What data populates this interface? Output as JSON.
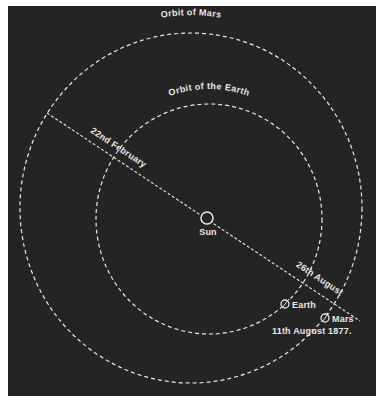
{
  "diagram": {
    "background_color": "#242424",
    "line_color": "#e8e8e8",
    "orbits": [
      {
        "name": "Mars",
        "label": "Orbit of Mars",
        "cx": 191,
        "cy": 208,
        "rx": 171,
        "ry": 175
      },
      {
        "name": "Earth",
        "label": "Orbit of the Earth",
        "cx": 209,
        "cy": 219,
        "rx": 113,
        "ry": 115
      }
    ],
    "sun": {
      "label": "Sun",
      "x": 207,
      "y": 218,
      "r": 6
    },
    "bodies": [
      {
        "name": "Earth",
        "label": "Earth",
        "x": 285,
        "y": 304,
        "r": 4
      },
      {
        "name": "Mars",
        "label": "Mars",
        "x": 325,
        "y": 318,
        "r": 4
      }
    ],
    "line_of_dates": {
      "start": {
        "x": 47,
        "y": 113
      },
      "end": {
        "x": 360,
        "y": 321
      },
      "labels": [
        {
          "text": "22nd February"
        },
        {
          "text": "26th August"
        }
      ]
    },
    "date_label": "11th August 1877."
  }
}
